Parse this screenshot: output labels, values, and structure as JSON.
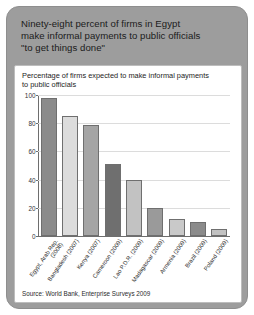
{
  "headline": {
    "lines": [
      "Ninety-eight percent of firms in Egypt",
      "make informal payments to public officials",
      "\"to get things done\""
    ]
  },
  "source_note": "Source: World Bank, Enterprise Surveys 2009",
  "chart_data": {
    "type": "bar",
    "title": "",
    "subtitle_lines": [
      "Percentage of firms expected to make informal payments",
      "to public officials"
    ],
    "xlabel": "",
    "ylabel": "",
    "ylim": [
      0,
      100
    ],
    "yticks": [
      0,
      20,
      40,
      60,
      80,
      100
    ],
    "ytick_labels": [
      "0",
      "20",
      "40",
      "60",
      "80",
      "100"
    ],
    "grid": true,
    "legend": "none",
    "categories": [
      "Egypt, Arab Rep. (2008)",
      "Bangladesh (2007)",
      "Kenya (2007)",
      "Cameroon (2009)",
      "Lao P.D.R. (2009)",
      "Madagascar (2009)",
      "Armenia (2009)",
      "Brazil (2009)",
      "Poland (2009)"
    ],
    "category_label_lines": [
      [
        "Egypt, Arab Rep.",
        "(2008)"
      ],
      [
        "Bangladesh (2007)"
      ],
      [
        "Kenya (2007)"
      ],
      [
        "Cameroon (2009)"
      ],
      [
        "Lao P.D.R. (2009)"
      ],
      [
        "Madagascar (2009)"
      ],
      [
        "Armenia (2009)"
      ],
      [
        "Brazil (2009)"
      ],
      [
        "Poland (2009)"
      ]
    ],
    "values": [
      98,
      85,
      79,
      51,
      40,
      20,
      12,
      10,
      5
    ],
    "bar_colors": [
      "#8b8b8b",
      "#dcdcdc",
      "#a5a5a5",
      "#6f6f6f",
      "#c2c2c2",
      "#9a9a9a",
      "#c9c9c9",
      "#8b8b8b",
      "#c2c2c2"
    ]
  },
  "colors": {
    "panel_background": "#9d9d9d",
    "card_background": "#ffffff",
    "gridline": "#dcdcdc",
    "axis": "#6e6e6e",
    "text": "#1b1b1b"
  }
}
